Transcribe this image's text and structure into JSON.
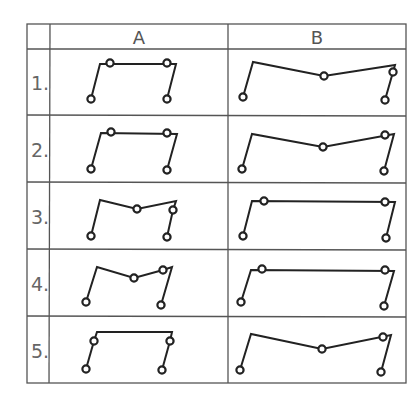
{
  "table": {
    "columns": [
      "A",
      "B"
    ],
    "rows": [
      {
        "label": "1."
      },
      {
        "label": "2."
      },
      {
        "label": "3."
      },
      {
        "label": "4."
      },
      {
        "label": "5."
      }
    ]
  },
  "colors": {
    "lines": "#222222",
    "grid": "#555555",
    "row_label": "#666666"
  },
  "figures": {
    "A1": {
      "path": [
        [
          91,
          99
        ],
        [
          100,
          64
        ],
        [
          176,
          64
        ],
        [
          167,
          99
        ]
      ],
      "joints": [
        [
          91,
          99
        ],
        [
          110,
          63
        ],
        [
          167,
          63
        ],
        [
          167,
          99
        ]
      ]
    },
    "A2": {
      "path": [
        [
          91,
          169
        ],
        [
          101,
          133
        ],
        [
          177,
          134
        ],
        [
          167,
          170
        ]
      ],
      "joints": [
        [
          91,
          169
        ],
        [
          111,
          132
        ],
        [
          167,
          133
        ],
        [
          167,
          170
        ]
      ]
    },
    "A3": {
      "path": [
        [
          91,
          236
        ],
        [
          100,
          200
        ],
        [
          137,
          209
        ],
        [
          176,
          201
        ],
        [
          173,
          210
        ],
        [
          167,
          237
        ]
      ],
      "joints": [
        [
          91,
          236
        ],
        [
          137,
          209
        ],
        [
          173,
          210
        ],
        [
          167,
          237
        ]
      ]
    },
    "A4": {
      "path": [
        [
          86,
          302
        ],
        [
          97,
          267
        ],
        [
          134,
          278
        ],
        [
          163,
          270
        ],
        [
          172,
          267
        ],
        [
          161,
          305
        ]
      ],
      "joints": [
        [
          86,
          302
        ],
        [
          134,
          278
        ],
        [
          163,
          270
        ],
        [
          161,
          305
        ]
      ]
    },
    "A5": {
      "path_segments": [
        [
          [
            94,
            341
          ],
          [
            97,
            332
          ],
          [
            172,
            332
          ],
          [
            170,
            341
          ]
        ],
        [
          [
            94,
            341
          ],
          [
            86,
            369
          ]
        ],
        [
          [
            170,
            341
          ],
          [
            162,
            370
          ]
        ]
      ],
      "joints": [
        [
          94,
          341
        ],
        [
          86,
          369
        ],
        [
          170,
          341
        ],
        [
          162,
          370
        ]
      ]
    },
    "B1": {
      "path": [
        [
          243,
          97
        ],
        [
          253,
          62
        ],
        [
          324,
          76
        ],
        [
          395,
          65
        ],
        [
          393,
          72
        ],
        [
          385,
          100
        ]
      ],
      "joints": [
        [
          243,
          97
        ],
        [
          324,
          76
        ],
        [
          393,
          72
        ],
        [
          385,
          100
        ]
      ]
    },
    "B2": {
      "path": [
        [
          242,
          169
        ],
        [
          252,
          134
        ],
        [
          323,
          147
        ],
        [
          394,
          134
        ],
        [
          384,
          171
        ]
      ],
      "joints": [
        [
          242,
          169
        ],
        [
          323,
          147
        ],
        [
          385,
          135
        ],
        [
          384,
          171
        ]
      ]
    },
    "B3": {
      "path": [
        [
          243,
          236
        ],
        [
          252,
          201
        ],
        [
          395,
          202
        ],
        [
          386,
          238
        ]
      ],
      "joints": [
        [
          243,
          236
        ],
        [
          264,
          201
        ],
        [
          385,
          202
        ],
        [
          386,
          238
        ]
      ]
    },
    "B4": {
      "path": [
        [
          241,
          302
        ],
        [
          251,
          270
        ],
        [
          394,
          271
        ],
        [
          384,
          306
        ]
      ],
      "joints": [
        [
          241,
          302
        ],
        [
          262,
          269
        ],
        [
          385,
          270
        ],
        [
          384,
          306
        ]
      ]
    },
    "B5": {
      "path": [
        [
          240,
          370
        ],
        [
          251,
          334
        ],
        [
          322,
          349
        ],
        [
          391,
          335
        ],
        [
          381,
          372
        ]
      ],
      "joints": [
        [
          240,
          370
        ],
        [
          322,
          349
        ],
        [
          383,
          337
        ],
        [
          381,
          372
        ]
      ]
    }
  }
}
